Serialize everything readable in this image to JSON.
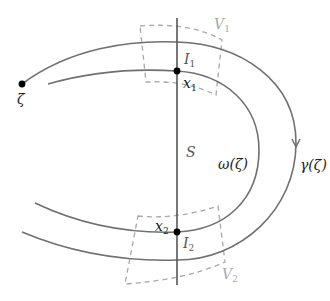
{
  "diagram": {
    "colors": {
      "curve": "#707070",
      "line": "#555555",
      "dashed": "#a0a0a0",
      "point": "#000000",
      "label_dark": "#222222",
      "label_mid": "#555555",
      "label_light": "#aaaaaa"
    },
    "labels": {
      "zeta": "ζ",
      "S": "S",
      "omega": "ω(ζ)",
      "gamma": "γ(ζ)",
      "I1_base": "I",
      "I1_sub": "1",
      "I2_base": "I",
      "I2_sub": "2",
      "x1_base": "x",
      "x1_sub": "1",
      "x2_base": "x",
      "x2_sub": "2",
      "V1_base": "V",
      "V1_sub": "1",
      "V2_base": "V",
      "V2_sub": "2"
    },
    "curves": [
      {
        "name": "gamma",
        "description": "outer arc from ζ, clockwise with downward arrow on right side"
      },
      {
        "name": "omega",
        "description": "inner arc parallel to γ"
      }
    ],
    "points": [
      {
        "name": "zeta",
        "x": 22,
        "y": 84
      },
      {
        "name": "x1",
        "x": 177,
        "y": 71
      },
      {
        "name": "x2",
        "x": 177,
        "y": 232
      }
    ],
    "transversal": {
      "name": "S",
      "x": 177,
      "y_top": 18,
      "y_bottom": 285
    },
    "regions": [
      {
        "name": "V1",
        "style": "dashed"
      },
      {
        "name": "V2",
        "style": "dashed"
      }
    ]
  }
}
